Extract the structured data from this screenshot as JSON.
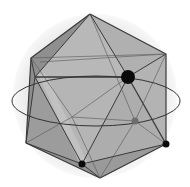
{
  "figure": {
    "colors": {
      "background": "#ffffff",
      "sphere": "#ececec",
      "face_light": "#b9b9b9",
      "face_mid": "#a6a6a6",
      "face_dark": "#8e8e8e",
      "edge": "#3a3a3a",
      "dot": "#0a0a0a",
      "dot_back": "#6e6e6e"
    },
    "sphere": {
      "cx": 95,
      "cy": 96,
      "r": 82
    },
    "equator_ellipse": {
      "cx": 96,
      "cy": 101,
      "rx": 84,
      "ry": 25
    },
    "vertices": {
      "top": [
        90,
        14
      ],
      "upper_left": [
        31,
        58
      ],
      "upper_right": [
        166,
        54
      ],
      "upper_front": [
        128,
        77
      ],
      "upper_left_inner": [
        35,
        77
      ],
      "mid_left_back": [
        70,
        117
      ],
      "back_mid": [
        135,
        121
      ],
      "lower_left": [
        26,
        143
      ],
      "lower_right": [
        166,
        144
      ],
      "bottom_left": [
        82,
        164
      ],
      "bottom": [
        100,
        178
      ],
      "upper_back": [
        58,
        38
      ]
    },
    "dots": [
      {
        "name": "upper-front-vertex-dot",
        "x": 128,
        "y": 77,
        "r": 7,
        "style": "front"
      },
      {
        "name": "back-vertex-dot",
        "x": 135,
        "y": 121,
        "r": 3.5,
        "style": "back"
      },
      {
        "name": "lower-right-vertex-dot",
        "x": 166,
        "y": 144,
        "r": 3.5,
        "style": "front"
      },
      {
        "name": "bottom-left-vertex-dot",
        "x": 82,
        "y": 164,
        "r": 3.5,
        "style": "front"
      }
    ]
  }
}
